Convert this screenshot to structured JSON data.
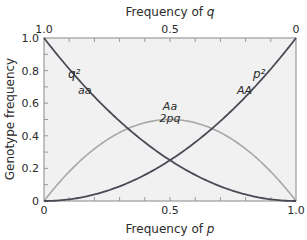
{
  "chart_data": {
    "type": "line",
    "title": "",
    "xlabel": "Frequency of p",
    "xlabel_top": "Frequency of q",
    "ylabel": "Genotype frequency",
    "xlim": [
      0,
      1
    ],
    "ylim": [
      0,
      1
    ],
    "grid": false,
    "bottom_ticks": [
      "0",
      "0.5",
      "1.0"
    ],
    "top_ticks": [
      "1.0",
      "0.5",
      "0"
    ],
    "y_ticks": [
      "0",
      "0.2",
      "0.4",
      "0.6",
      "0.8",
      "1.0"
    ],
    "x": [
      0,
      0.1,
      0.2,
      0.3,
      0.4,
      0.5,
      0.6,
      0.7,
      0.8,
      0.9,
      1.0
    ],
    "series": [
      {
        "name": "aa (q^2)",
        "label_top": "q²",
        "label_bottom": "aa",
        "color": "#4a4a55",
        "values": [
          1.0,
          0.81,
          0.64,
          0.49,
          0.36,
          0.25,
          0.16,
          0.09,
          0.04,
          0.01,
          0.0
        ]
      },
      {
        "name": "Aa (2pq)",
        "label_top": "Aa",
        "label_bottom": "2pq",
        "color": "#a8a8a8",
        "values": [
          0.0,
          0.18,
          0.32,
          0.42,
          0.48,
          0.5,
          0.48,
          0.42,
          0.32,
          0.18,
          0.0
        ]
      },
      {
        "name": "AA (p^2)",
        "label_top": "p²",
        "label_bottom": "AA",
        "color": "#4a4a55",
        "values": [
          0.0,
          0.01,
          0.04,
          0.09,
          0.16,
          0.25,
          0.36,
          0.49,
          0.64,
          0.81,
          1.0
        ]
      }
    ]
  },
  "colors": {
    "plot_bg": "#f1f1f1",
    "axis": "#888888",
    "dark_curve": "#4a4a55",
    "light_curve": "#a8a8a8"
  }
}
